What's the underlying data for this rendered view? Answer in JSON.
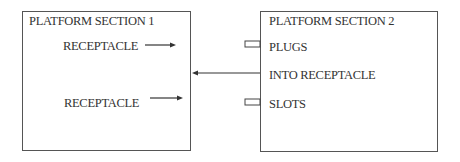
{
  "diagram": {
    "platform_section_1": {
      "title": "PLATFORM SECTION  1",
      "items": [
        {
          "label": "RECEPTACLE",
          "arrow": "right"
        },
        {
          "label": "RECEPTACLE",
          "arrow": "right"
        }
      ]
    },
    "platform_section_2": {
      "title": "PLATFORM SECTION  2",
      "items": [
        {
          "label": "PLUGS",
          "connector": "tab"
        },
        {
          "label": "INTO RECEPTACLE",
          "connector": "arrow-to-section-1"
        },
        {
          "label": "SLOTS",
          "connector": "tab"
        }
      ]
    },
    "connections": [
      {
        "from": "platform_section_2",
        "to": "platform_section_1",
        "label": "INTO RECEPTACLE",
        "direction": "left"
      }
    ]
  }
}
